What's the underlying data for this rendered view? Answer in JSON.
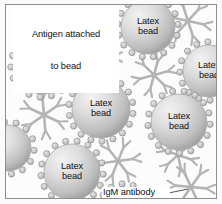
{
  "figure": {
    "background_color": "#fcfcfc",
    "frame_color": "#8e8e8e"
  },
  "callouts": [
    {
      "name": "antigen-callout",
      "text": "Antigen attached\nto bead",
      "line1": "Antigen attached",
      "line2": "to bead"
    },
    {
      "name": "igm-callout",
      "text": "IgM antibody"
    }
  ],
  "beads": {
    "label": "Latex bead",
    "label_line1": "Latex",
    "label_line2": "bead",
    "count": 8,
    "fill_light": "#ededed",
    "fill_dark": "#9a9a9a",
    "antigen_dot_color": "#c9c9c9",
    "antigen_dot_stroke": "#8d8d8d",
    "items": [
      {
        "id": "bead-top-center",
        "cx": 142,
        "cy": 22,
        "r": 27,
        "label": "Latex bead"
      },
      {
        "id": "bead-left-upper",
        "cx": 36,
        "cy": 61,
        "r": 28,
        "label": "Latex bead"
      },
      {
        "id": "bead-right-upper",
        "cx": 203,
        "cy": 66,
        "r": 26,
        "label": "Latex bead"
      },
      {
        "id": "bead-center",
        "cx": 95,
        "cy": 104,
        "r": 29,
        "label": "Latex bead"
      },
      {
        "id": "bead-right-lower",
        "cx": 173,
        "cy": 117,
        "r": 28,
        "label": "Latex bead"
      },
      {
        "id": "bead-left-edge",
        "cx": 2,
        "cy": 143,
        "r": 23,
        "label": ""
      },
      {
        "id": "bead-bottom-left",
        "cx": 66,
        "cy": 167,
        "r": 28,
        "label": "Latex bead"
      },
      {
        "id": "bead-bottom-center",
        "cx": 118,
        "cy": 204,
        "r": 22,
        "label": ""
      }
    ]
  },
  "antibodies": {
    "label": "IgM antibody",
    "count": 7,
    "color": "#b4b4b4",
    "stroke": "#a0a0a0",
    "items": [
      {
        "id": "igm-top-right",
        "cx": 182,
        "cy": 16,
        "r": 24,
        "rot": 12
      },
      {
        "id": "igm-upper-center",
        "cx": 89,
        "cy": 52,
        "r": 27,
        "rot": 0
      },
      {
        "id": "igm-mid-left",
        "cx": 38,
        "cy": 110,
        "r": 24,
        "rot": 25
      },
      {
        "id": "igm-mid-right",
        "cx": 148,
        "cy": 70,
        "r": 22,
        "rot": -15
      },
      {
        "id": "igm-center-right",
        "cx": 172,
        "cy": 150,
        "r": 21,
        "rot": 18
      },
      {
        "id": "igm-bottom-center",
        "cx": 112,
        "cy": 156,
        "r": 23,
        "rot": -8
      },
      {
        "id": "igm-bottom-right",
        "cx": 185,
        "cy": 182,
        "r": 24,
        "rot": 5
      }
    ]
  },
  "leader_lines": [
    {
      "id": "antigen-leader",
      "from": [
        58,
        31
      ],
      "to": [
        47,
        42
      ]
    },
    {
      "id": "igm-leader",
      "from": [
        153,
        190
      ],
      "to": [
        182,
        184
      ]
    }
  ]
}
